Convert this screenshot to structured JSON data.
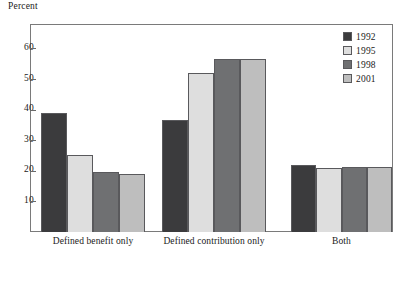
{
  "axis_title": "Percent",
  "legend": {
    "entries": [
      {
        "label": "1992",
        "color": "#3b3b3d"
      },
      {
        "label": "1995",
        "color": "#dedede"
      },
      {
        "label": "1998",
        "color": "#6f7072"
      },
      {
        "label": "2001",
        "color": "#bebebe"
      }
    ]
  },
  "chart_data": {
    "type": "bar",
    "title": "",
    "subtitle": "",
    "xlabel": "",
    "ylabel": "Percent",
    "ylim": [
      0,
      68
    ],
    "yticks": [
      10,
      20,
      30,
      40,
      50,
      60
    ],
    "ytick_labels": [
      "10",
      "20",
      "30",
      "40",
      "50",
      "60"
    ],
    "grid": false,
    "legend_position": "top-right",
    "categories": [
      "Defined benefit only",
      "Defined contribution only",
      "Both"
    ],
    "series": [
      {
        "name": "1992",
        "color": "#3b3b3d",
        "values": [
          39,
          36.5,
          21.8
        ]
      },
      {
        "name": "1995",
        "color": "#dedede",
        "values": [
          25.3,
          52,
          20.8
        ]
      },
      {
        "name": "1998",
        "color": "#6f7072",
        "values": [
          19.6,
          56.5,
          21.3
        ]
      },
      {
        "name": "2001",
        "color": "#bebebe",
        "values": [
          19,
          56.6,
          21.2
        ]
      }
    ]
  }
}
